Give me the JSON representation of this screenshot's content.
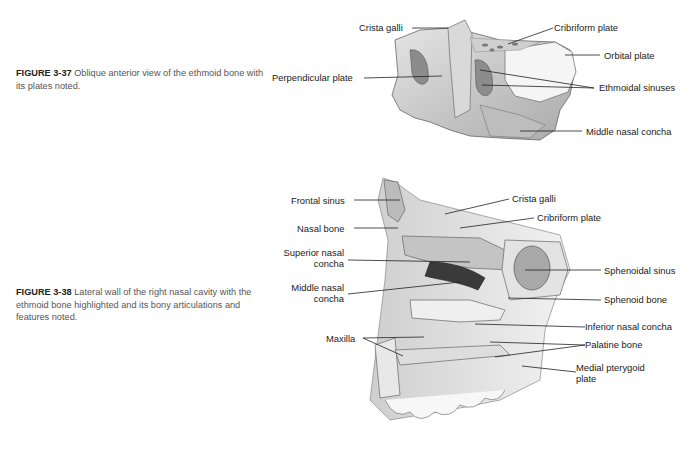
{
  "figures": [
    {
      "number": "FIGURE 3-37",
      "caption": "Oblique anterior view of the ethmoid bone with its plates noted.",
      "labels": {
        "crista_galli": "Crista galli",
        "cribriform_plate": "Cribriform plate",
        "orbital_plate": "Orbital plate",
        "perpendicular_plate": "Perpendicular plate",
        "ethmoidal_sinuses": "Ethmoidal sinuses",
        "middle_nasal_concha": "Middle nasal concha"
      }
    },
    {
      "number": "FIGURE 3-38",
      "caption": "Lateral wall of the right nasal cavity with the ethmoid bone highlighted and its bony articulations and features noted.",
      "labels": {
        "frontal_sinus": "Frontal sinus",
        "crista_galli": "Crista galli",
        "cribriform_plate": "Cribriform plate",
        "nasal_bone": "Nasal bone",
        "superior_nasal_concha_1": "Superior nasal",
        "superior_nasal_concha_2": "concha",
        "middle_nasal_concha_1": "Middle nasal",
        "middle_nasal_concha_2": "concha",
        "sphenoidal_sinus": "Sphenoidal sinus",
        "sphenoid_bone": "Sphenoid bone",
        "inferior_nasal_concha": "Inferior nasal concha",
        "maxilla": "Maxilla",
        "palatine_bone": "Palatine bone",
        "medial_pterygoid_plate_1": "Medial pterygoid",
        "medial_pterygoid_plate_2": "plate"
      }
    }
  ]
}
